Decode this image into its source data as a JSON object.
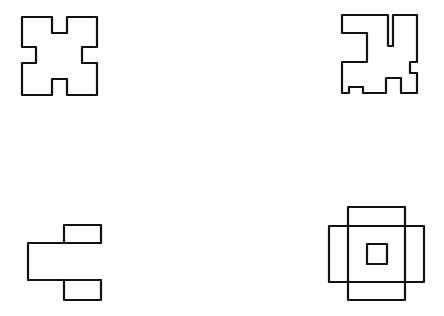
{
  "figure": {
    "stroke_color": "#111111",
    "background": "#ffffff",
    "shapes": [
      {
        "id": "shape-1",
        "position": "top-left",
        "kind": "symmetric cross-notched square"
      },
      {
        "id": "shape-2",
        "position": "top-right",
        "kind": "irregular notched square"
      },
      {
        "id": "shape-3",
        "position": "bottom-left",
        "kind": "bracket of three rectangles"
      },
      {
        "id": "shape-4",
        "position": "bottom-right",
        "kind": "overlapping rectangles with inner square"
      }
    ]
  }
}
